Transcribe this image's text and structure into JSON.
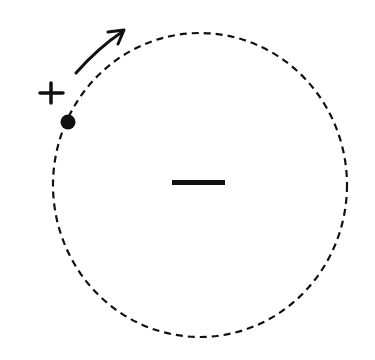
{
  "diagram": {
    "orbit": {
      "cx": 200,
      "cy": 185,
      "rx": 147,
      "ry": 152,
      "style": "dashed",
      "color": "#111111"
    },
    "center_charge": {
      "symbol": "−",
      "sign": "negative"
    },
    "orbiting_charge": {
      "symbol": "+",
      "sign": "positive",
      "x": 68,
      "y": 122
    },
    "motion_arrow": {
      "direction": "clockwise",
      "from": [
        76,
        73
      ],
      "to": [
        124,
        30
      ]
    }
  }
}
